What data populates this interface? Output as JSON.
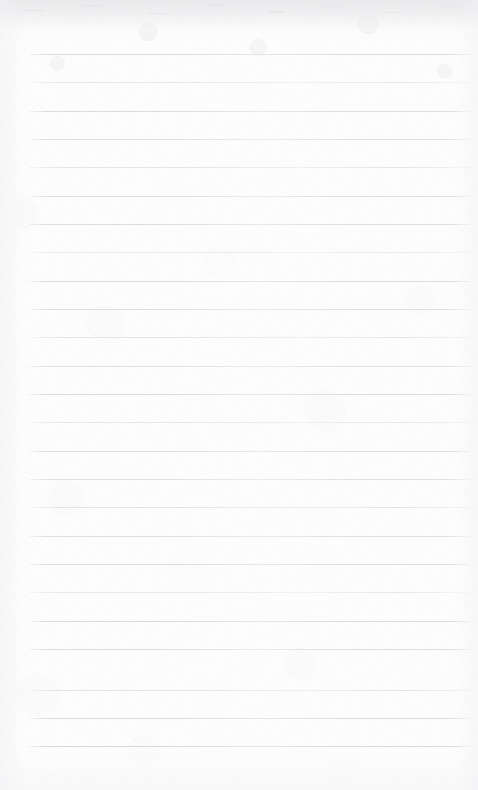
{
  "document": {
    "type": "scanned-lined-notebook-page",
    "title": "Blank ruled notebook page",
    "orientation": "portrait",
    "page_width": 478,
    "page_height": 790,
    "text_content": "",
    "handwriting_present": "no",
    "printed_text_present": "no"
  },
  "paper": {
    "base_color": "#fdfdfd",
    "texture": "mottled-fiber",
    "top_edge_band_color": "#dedee1",
    "top_edge_band_height": 34,
    "vignette_color": "#eeeef1"
  },
  "ruling": {
    "style": "horizontal-ruled",
    "line_color": "#c6c6ca",
    "line_thickness": 1,
    "line_spacing": 28.3,
    "first_line_y": 54,
    "last_line_y": 746,
    "line_start_x": 29,
    "line_end_x": 471,
    "line_count": 25,
    "margin_rule_present": "no",
    "lines": [
      {
        "index": 1,
        "y": 54,
        "x1": 29,
        "x2": 471,
        "opacity": 0.85
      },
      {
        "index": 2,
        "y": 82,
        "x1": 29,
        "x2": 471,
        "opacity": 0.72
      },
      {
        "index": 3,
        "y": 111,
        "x1": 29,
        "x2": 471,
        "opacity": 0.8
      },
      {
        "index": 4,
        "y": 139,
        "x1": 29,
        "x2": 471,
        "opacity": 0.7
      },
      {
        "index": 5,
        "y": 167,
        "x1": 29,
        "x2": 471,
        "opacity": 0.82
      },
      {
        "index": 6,
        "y": 196,
        "x1": 29,
        "x2": 471,
        "opacity": 0.74
      },
      {
        "index": 7,
        "y": 224,
        "x1": 29,
        "x2": 471,
        "opacity": 0.78
      },
      {
        "index": 8,
        "y": 252,
        "x1": 29,
        "x2": 471,
        "opacity": 0.68
      },
      {
        "index": 9,
        "y": 281,
        "x1": 29,
        "x2": 471,
        "opacity": 0.84
      },
      {
        "index": 10,
        "y": 309,
        "x1": 29,
        "x2": 471,
        "opacity": 0.73
      },
      {
        "index": 11,
        "y": 337,
        "x1": 29,
        "x2": 471,
        "opacity": 0.8
      },
      {
        "index": 12,
        "y": 366,
        "x1": 29,
        "x2": 471,
        "opacity": 0.7
      },
      {
        "index": 13,
        "y": 394,
        "x1": 29,
        "x2": 471,
        "opacity": 0.83
      },
      {
        "index": 14,
        "y": 422,
        "x1": 29,
        "x2": 471,
        "opacity": 0.75
      },
      {
        "index": 15,
        "y": 451,
        "x1": 29,
        "x2": 471,
        "opacity": 0.79
      },
      {
        "index": 16,
        "y": 479,
        "x1": 29,
        "x2": 471,
        "opacity": 0.69
      },
      {
        "index": 17,
        "y": 507,
        "x1": 29,
        "x2": 471,
        "opacity": 0.85
      },
      {
        "index": 18,
        "y": 536,
        "x1": 29,
        "x2": 471,
        "opacity": 0.72
      },
      {
        "index": 19,
        "y": 564,
        "x1": 29,
        "x2": 471,
        "opacity": 0.81
      },
      {
        "index": 20,
        "y": 592,
        "x1": 29,
        "x2": 471,
        "opacity": 0.71
      },
      {
        "index": 21,
        "y": 621,
        "x1": 29,
        "x2": 471,
        "opacity": 0.86
      },
      {
        "index": 22,
        "y": 649,
        "x1": 29,
        "x2": 471,
        "opacity": 0.76
      },
      {
        "index": 23,
        "y": 690,
        "x1": 29,
        "x2": 471,
        "opacity": 0.88
      },
      {
        "index": 24,
        "y": 718,
        "x1": 29,
        "x2": 471,
        "opacity": 0.82
      },
      {
        "index": 25,
        "y": 746,
        "x1": 29,
        "x2": 471,
        "opacity": 0.9
      }
    ]
  }
}
